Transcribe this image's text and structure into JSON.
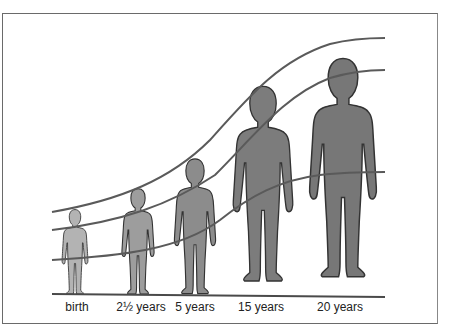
{
  "figure": {
    "stages": [
      {
        "label": "birth",
        "x": 75,
        "head_top": 209,
        "color": "#b3b3b3"
      },
      {
        "label": "2½ years",
        "x": 138,
        "head_top": 188,
        "color": "#9d9d9d"
      },
      {
        "label": "5 years",
        "x": 195,
        "head_top": 158,
        "color": "#8c8c8c"
      },
      {
        "label": "15 years",
        "x": 263,
        "head_top": 73,
        "color": "#7c7c7c"
      },
      {
        "label": "20 years",
        "x": 342,
        "head_top": 41,
        "color": "#777777"
      }
    ],
    "curves": [
      {
        "name": "head-top-curve",
        "color": "#5a5a5a"
      },
      {
        "name": "shoulder-curve",
        "color": "#5a5a5a"
      },
      {
        "name": "hip-curve",
        "color": "#5a5a5a"
      },
      {
        "name": "ground-line",
        "color": "#4a4a4a"
      }
    ]
  }
}
